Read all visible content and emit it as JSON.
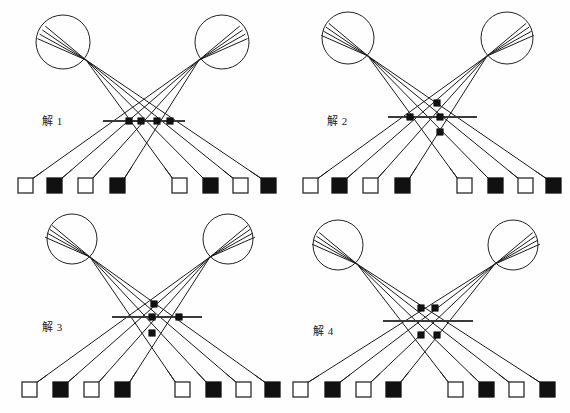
{
  "figure": {
    "title": "",
    "background_color": "#fefefe",
    "width": 570,
    "height": 413,
    "ink_color": "#111111",
    "line_color": "#1b1b1b"
  },
  "panels": [
    {
      "id": "panel-1",
      "label": "解 1",
      "label_x": 42,
      "label_y": 112,
      "origin_x": 0,
      "origin_y": 0,
      "left_lens": {
        "cx": 63,
        "cy": 42,
        "r": 27,
        "focus_x": 86,
        "focus_y": 60
      },
      "right_lens": {
        "cx": 222,
        "cy": 42,
        "r": 27,
        "focus_x": 199,
        "focus_y": 60
      },
      "axis": {
        "x1": 103,
        "y1": 121,
        "x2": 185,
        "y2": 121
      },
      "nodes": [
        {
          "x": 129,
          "y": 121
        },
        {
          "x": 141,
          "y": 121
        },
        {
          "x": 157,
          "y": 121
        },
        {
          "x": 170,
          "y": 121
        }
      ],
      "squares": [
        {
          "x": 18,
          "y": 178,
          "fill": "open"
        },
        {
          "x": 47,
          "y": 178,
          "fill": "filled"
        },
        {
          "x": 78,
          "y": 178,
          "fill": "open"
        },
        {
          "x": 110,
          "y": 178,
          "fill": "filled"
        },
        {
          "x": 172,
          "y": 178,
          "fill": "open"
        },
        {
          "x": 203,
          "y": 178,
          "fill": "filled"
        },
        {
          "x": 233,
          "y": 178,
          "fill": "open"
        },
        {
          "x": 261,
          "y": 178,
          "fill": "filled"
        }
      ]
    },
    {
      "id": "panel-2",
      "label": "解 2",
      "label_x": 327,
      "label_y": 112,
      "origin_x": 285,
      "origin_y": 0,
      "left_lens": {
        "cx": 63,
        "cy": 38,
        "r": 26,
        "focus_x": 83,
        "focus_y": 56
      },
      "right_lens": {
        "cx": 222,
        "cy": 38,
        "r": 26,
        "focus_x": 202,
        "focus_y": 56
      },
      "axis": {
        "x1": 103,
        "y1": 117,
        "x2": 192,
        "y2": 117
      },
      "nodes": [
        {
          "x": 152,
          "y": 103
        },
        {
          "x": 125,
          "y": 117
        },
        {
          "x": 155,
          "y": 117
        },
        {
          "x": 155,
          "y": 132
        }
      ],
      "squares": [
        {
          "x": 18,
          "y": 178,
          "fill": "open"
        },
        {
          "x": 47,
          "y": 178,
          "fill": "filled"
        },
        {
          "x": 78,
          "y": 178,
          "fill": "open"
        },
        {
          "x": 110,
          "y": 178,
          "fill": "filled"
        },
        {
          "x": 172,
          "y": 178,
          "fill": "open"
        },
        {
          "x": 203,
          "y": 178,
          "fill": "filled"
        },
        {
          "x": 233,
          "y": 178,
          "fill": "open"
        },
        {
          "x": 261,
          "y": 178,
          "fill": "filled"
        }
      ]
    },
    {
      "id": "panel-3",
      "label": "解 3",
      "label_x": 42,
      "label_y": 318,
      "origin_x": 0,
      "origin_y": 207,
      "left_lens": {
        "cx": 72,
        "cy": 32,
        "r": 25,
        "focus_x": 90,
        "focus_y": 50
      },
      "right_lens": {
        "cx": 228,
        "cy": 32,
        "r": 25,
        "focus_x": 210,
        "focus_y": 50
      },
      "axis": {
        "x1": 112,
        "y1": 110,
        "x2": 202,
        "y2": 110
      },
      "nodes": [
        {
          "x": 154,
          "y": 97
        },
        {
          "x": 152,
          "y": 110
        },
        {
          "x": 179,
          "y": 110
        },
        {
          "x": 152,
          "y": 126
        }
      ],
      "squares": [
        {
          "x": 22,
          "y": 175,
          "fill": "open"
        },
        {
          "x": 53,
          "y": 175,
          "fill": "filled"
        },
        {
          "x": 84,
          "y": 175,
          "fill": "open"
        },
        {
          "x": 115,
          "y": 175,
          "fill": "filled"
        },
        {
          "x": 175,
          "y": 175,
          "fill": "open"
        },
        {
          "x": 206,
          "y": 175,
          "fill": "filled"
        },
        {
          "x": 236,
          "y": 175,
          "fill": "open"
        },
        {
          "x": 265,
          "y": 175,
          "fill": "filled"
        }
      ]
    },
    {
      "id": "panel-4",
      "label": "解 4",
      "label_x": 313,
      "label_y": 322,
      "origin_x": 285,
      "origin_y": 207,
      "left_lens": {
        "cx": 53,
        "cy": 38,
        "r": 25,
        "focus_x": 72,
        "focus_y": 57
      },
      "right_lens": {
        "cx": 228,
        "cy": 38,
        "r": 25,
        "focus_x": 210,
        "focus_y": 57
      },
      "axis": {
        "x1": 98,
        "y1": 114,
        "x2": 188,
        "y2": 114
      },
      "nodes": [
        {
          "x": 136,
          "y": 101
        },
        {
          "x": 150,
          "y": 101
        },
        {
          "x": 136,
          "y": 128
        },
        {
          "x": 152,
          "y": 128
        }
      ],
      "squares": [
        {
          "x": 8,
          "y": 175,
          "fill": "open"
        },
        {
          "x": 40,
          "y": 175,
          "fill": "filled"
        },
        {
          "x": 71,
          "y": 175,
          "fill": "open"
        },
        {
          "x": 101,
          "y": 175,
          "fill": "filled"
        },
        {
          "x": 163,
          "y": 175,
          "fill": "open"
        },
        {
          "x": 194,
          "y": 175,
          "fill": "filled"
        },
        {
          "x": 224,
          "y": 175,
          "fill": "open"
        },
        {
          "x": 255,
          "y": 175,
          "fill": "filled"
        }
      ]
    }
  ],
  "geometry": {
    "square_size": 15,
    "node_radius": 3.2,
    "fan_count": 4,
    "fan_spread_deg": 16
  }
}
